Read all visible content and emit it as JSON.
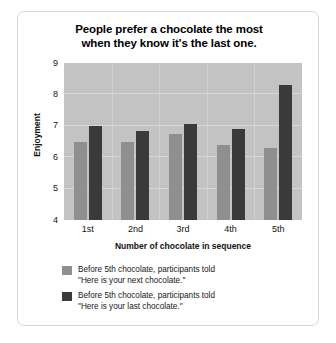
{
  "chart_data": {
    "type": "bar",
    "title_lines": [
      "People prefer a chocolate the most",
      "when they know it's the last one."
    ],
    "title": "People prefer a chocolate the most when they know it's the last one.",
    "xlabel": "Number of chocolate in sequence",
    "ylabel": "Enjoyment",
    "categories": [
      "1st",
      "2nd",
      "3rd",
      "4th",
      "5th"
    ],
    "ylim": [
      4,
      9
    ],
    "yticks": [
      "9",
      "8",
      "7",
      "6",
      "5",
      "4"
    ],
    "grid": true,
    "legend_position": "bottom-left",
    "series": [
      {
        "name": "Before 5th chocolate, participants told \"Here is your next chocolate.\"",
        "name_lines": [
          "Before 5th chocolate, participants told",
          "\"Here is your next chocolate.\""
        ],
        "color": "#8f8f8f",
        "values": [
          6.5,
          6.5,
          6.75,
          6.4,
          6.3
        ]
      },
      {
        "name": "Before 5th chocolate, participants told \"Here is your last chocolate.\"",
        "name_lines": [
          "Before 5th chocolate, participants told",
          "\"Here is your last chocolate.\""
        ],
        "color": "#3a3a3a",
        "values": [
          7.0,
          6.85,
          7.05,
          6.9,
          8.3
        ]
      }
    ],
    "plot_background": "#c3c3c3",
    "gridline_color": "#d8d8d8"
  }
}
